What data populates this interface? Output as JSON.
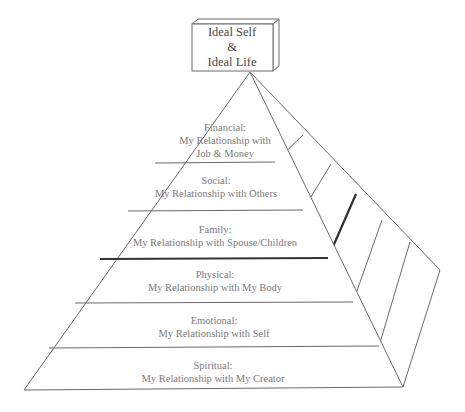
{
  "top_box": {
    "line1": "Ideal Self",
    "line2": "&",
    "line3": "Ideal Life"
  },
  "levels": [
    {
      "name": "Financial:",
      "desc_line1": "My Relationship with",
      "desc_line2": "Job & Money"
    },
    {
      "name": "Social:",
      "desc": "My Relationship with Others"
    },
    {
      "name": "Family:",
      "desc": "My Relationship with Spouse/Children"
    },
    {
      "name": "Physical:",
      "desc": "My Relationship with My Body"
    },
    {
      "name": "Emotional:",
      "desc": "My Relationship with Self"
    },
    {
      "name": "Spiritual:",
      "desc": "My Relationship with My Creator"
    }
  ],
  "colors": {
    "line": "#6a6a6a",
    "emphasis_line": "#333333",
    "text": "#7a7a7a",
    "background": "#ffffff"
  }
}
